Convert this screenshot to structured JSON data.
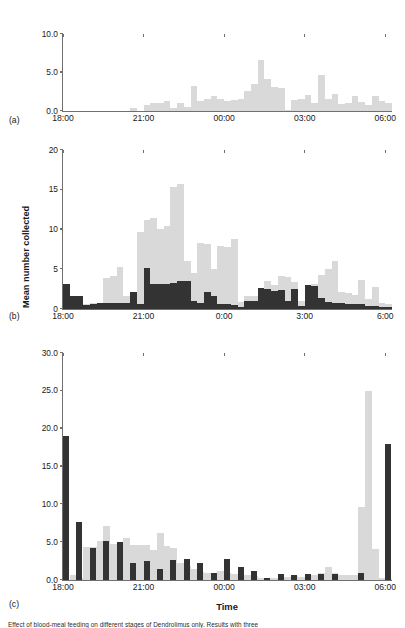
{
  "figure": {
    "caption_clipped": "Effect of blood-meal feeding on different stages of Dendrolimus only. Results with three",
    "colors": {
      "light": "#d9d9d9",
      "dark": "#333333",
      "axis": "#6f6f6f"
    }
  },
  "axis_titles": {
    "y": "Mean number collected",
    "x": "Time"
  },
  "panels": [
    {
      "letter": "(a)",
      "yticks": [
        "0.0",
        "5.0",
        "10.0"
      ],
      "ytick_values": [
        0,
        5,
        10
      ],
      "ylim": [
        0,
        10
      ],
      "xticks": [
        "18:00",
        "21:00",
        "00:00",
        "03:00",
        "06:00"
      ],
      "xtick_values": [
        18,
        21,
        24,
        27,
        30
      ],
      "xlim": [
        18,
        30.25
      ]
    },
    {
      "letter": "(b)",
      "yticks": [
        "0",
        "5",
        "10",
        "15",
        "20"
      ],
      "ytick_values": [
        0,
        5,
        10,
        15,
        20
      ],
      "ylim": [
        0,
        20
      ],
      "xticks": [
        "18:00",
        "21:00",
        "0:00",
        "3:00",
        "6:00"
      ],
      "xtick_values": [
        18,
        21,
        24,
        27,
        30
      ],
      "xlim": [
        18,
        30.25
      ]
    },
    {
      "letter": "(c)",
      "yticks": [
        "0.0",
        "5.0",
        "10.0",
        "15.0",
        "20.0",
        "25.0",
        "30.0"
      ],
      "ytick_values": [
        0,
        5,
        10,
        15,
        20,
        25,
        30
      ],
      "ylim": [
        0,
        30
      ],
      "xticks": [
        "18:00",
        "21:00",
        "00:00",
        "03:00",
        "06:00"
      ],
      "xtick_values": [
        18,
        21,
        24,
        27,
        30
      ],
      "xlim": [
        18,
        30.25
      ]
    }
  ],
  "chart_data": [
    {
      "id": "panel-a",
      "type": "bar",
      "title": "(a)",
      "xlabel": "",
      "ylabel": "Mean number collected",
      "ylim": [
        0,
        10
      ],
      "xlim": [
        18,
        30.25
      ],
      "grid": false,
      "legend": null,
      "bin_hours": 0.25,
      "series": [
        {
          "name": "light-grey",
          "color": "#d9d9d9",
          "x": [
            18.0,
            18.25,
            18.5,
            18.75,
            19.0,
            19.25,
            19.5,
            19.75,
            20.0,
            20.25,
            20.5,
            20.75,
            21.0,
            21.25,
            21.5,
            21.75,
            22.0,
            22.25,
            22.5,
            22.75,
            23.0,
            23.25,
            23.5,
            23.75,
            24.0,
            24.25,
            24.5,
            24.75,
            25.0,
            25.25,
            25.5,
            25.75,
            26.0,
            26.25,
            26.5,
            26.75,
            27.0,
            27.25,
            27.5,
            27.75,
            28.0,
            28.25,
            28.5,
            28.75,
            29.0,
            29.25,
            29.5,
            29.75,
            30.0
          ],
          "values": [
            0,
            0,
            0,
            0,
            0,
            0,
            0,
            0,
            0,
            0,
            0.35,
            0,
            0.8,
            1.0,
            1.1,
            1.3,
            0.4,
            1.1,
            0.5,
            3.3,
            1.3,
            1.6,
            1.9,
            1.6,
            1.3,
            1.4,
            1.5,
            2.6,
            3.5,
            6.6,
            4.1,
            3.1,
            3.0,
            0.1,
            1.4,
            1.5,
            2.1,
            1.1,
            4.7,
            1.6,
            2.2,
            0.9,
            1.0,
            1.9,
            1.2,
            0.8,
            2.0,
            1.3,
            1.1
          ]
        }
      ]
    },
    {
      "id": "panel-b",
      "type": "bar",
      "title": "(b)",
      "xlabel": "",
      "ylabel": "Mean number collected",
      "ylim": [
        0,
        20
      ],
      "xlim": [
        18,
        30.25
      ],
      "grid": false,
      "legend": null,
      "bin_hours": 0.25,
      "note": "dark series drawn in front of light series (overlay, not stacked)",
      "series": [
        {
          "name": "light-grey",
          "color": "#d9d9d9",
          "x": [
            18.0,
            18.25,
            18.5,
            18.75,
            19.0,
            19.25,
            19.5,
            19.75,
            20.0,
            20.25,
            20.5,
            20.75,
            21.0,
            21.25,
            21.5,
            21.75,
            22.0,
            22.25,
            22.5,
            22.75,
            23.0,
            23.25,
            23.5,
            23.75,
            24.0,
            24.25,
            24.5,
            24.75,
            25.0,
            25.25,
            25.5,
            25.75,
            26.0,
            26.25,
            26.5,
            26.75,
            27.0,
            27.25,
            27.5,
            27.75,
            28.0,
            28.25,
            28.5,
            28.75,
            29.0,
            29.25,
            29.5,
            29.75,
            30.0
          ],
          "values": [
            0,
            0,
            0,
            0.6,
            0.7,
            0.8,
            3.9,
            4.2,
            5.3,
            1.6,
            1.9,
            9.7,
            11.2,
            11.4,
            10.1,
            10.4,
            15.3,
            15.7,
            6.0,
            4.5,
            8.3,
            8.2,
            5.0,
            7.9,
            7.8,
            8.8,
            0.9,
            1.7,
            1.7,
            1.5,
            3.5,
            3.0,
            4.1,
            4.0,
            3.4,
            1.0,
            0.9,
            3.2,
            4.3,
            5.0,
            6.0,
            2.1,
            2.0,
            1.8,
            3.7,
            1.2,
            2.8,
            0.7,
            0.6
          ]
        },
        {
          "name": "dark",
          "color": "#333333",
          "x": [
            18.0,
            18.25,
            18.5,
            18.75,
            19.0,
            19.25,
            19.5,
            19.75,
            20.0,
            20.25,
            20.5,
            20.75,
            21.0,
            21.25,
            21.5,
            21.75,
            22.0,
            22.25,
            22.5,
            22.75,
            23.0,
            23.25,
            23.5,
            23.75,
            24.0,
            24.25,
            24.5,
            24.75,
            25.0,
            25.25,
            25.5,
            25.75,
            26.0,
            26.25,
            26.5,
            26.75,
            27.0,
            27.25,
            27.5,
            27.75,
            28.0,
            28.25,
            28.5,
            28.75,
            29.0,
            29.25,
            29.5,
            29.75,
            30.0
          ],
          "values": [
            3.1,
            1.6,
            1.6,
            0.5,
            0.6,
            0.8,
            0.7,
            0.8,
            0.8,
            0.8,
            2.2,
            0.6,
            5.1,
            3.1,
            3.2,
            3.2,
            3.3,
            3.5,
            3.5,
            1.0,
            0.8,
            2.1,
            1.6,
            0.6,
            0.6,
            0.5,
            0.3,
            1.0,
            1.0,
            2.6,
            2.5,
            2.3,
            2.4,
            1.0,
            2.5,
            0.4,
            3.0,
            2.9,
            1.4,
            0.9,
            0.8,
            0.7,
            0.6,
            0.6,
            0.6,
            0.4,
            0.4,
            0.3,
            0.3
          ]
        }
      ]
    },
    {
      "id": "panel-c",
      "type": "bar",
      "title": "(c)",
      "xlabel": "Time",
      "ylabel": "Mean number collected",
      "ylim": [
        0,
        30
      ],
      "xlim": [
        18,
        30.25
      ],
      "grid": false,
      "legend": null,
      "bin_hours": 0.25,
      "note": "dark bars are narrower and sit in front of wider light-grey bars",
      "series": [
        {
          "name": "light-grey",
          "color": "#d9d9d9",
          "x": [
            18.0,
            18.25,
            18.5,
            18.75,
            19.0,
            19.25,
            19.5,
            19.75,
            20.0,
            20.25,
            20.5,
            20.75,
            21.0,
            21.25,
            21.5,
            21.75,
            22.0,
            22.25,
            22.5,
            22.75,
            23.0,
            23.25,
            23.5,
            23.75,
            24.0,
            24.25,
            24.5,
            24.75,
            25.0,
            25.25,
            25.5,
            25.75,
            26.0,
            26.25,
            26.5,
            26.75,
            27.0,
            27.25,
            27.5,
            27.75,
            28.0,
            28.25,
            28.5,
            28.75,
            29.0,
            29.25,
            29.5,
            29.75,
            30.0
          ],
          "values": [
            0,
            0.7,
            0.3,
            4.3,
            4.4,
            5.2,
            7.2,
            4.8,
            5.0,
            5.5,
            4.6,
            4.6,
            4.6,
            4.0,
            6.2,
            4.5,
            4.2,
            2.2,
            1.9,
            1.5,
            1.1,
            0.9,
            0.9,
            1.2,
            0.9,
            0.8,
            0.9,
            0.6,
            0.5,
            0.3,
            0.3,
            0.3,
            0.4,
            0.4,
            0.5,
            0.4,
            0.5,
            0.6,
            0.9,
            1.7,
            0.9,
            0.7,
            0.6,
            0.6,
            9.6,
            25.0,
            4.1,
            0.3,
            0.2
          ]
        },
        {
          "name": "dark",
          "color": "#333333",
          "x": [
            18.0,
            18.5,
            19.0,
            19.5,
            20.0,
            20.5,
            21.0,
            21.5,
            22.0,
            22.5,
            23.0,
            23.5,
            24.0,
            24.5,
            25.0,
            25.5,
            26.0,
            26.5,
            27.0,
            27.5,
            28.0,
            28.5,
            29.0,
            29.5,
            30.0
          ],
          "values": [
            19.0,
            7.7,
            4.2,
            5.1,
            5.0,
            2.2,
            2.5,
            1.5,
            2.7,
            2.8,
            2.3,
            0.9,
            2.8,
            1.7,
            1.2,
            0.3,
            0.8,
            0.6,
            0.8,
            0.8,
            0.8,
            0.0,
            0.9,
            0.0,
            18.0
          ]
        }
      ]
    }
  ]
}
